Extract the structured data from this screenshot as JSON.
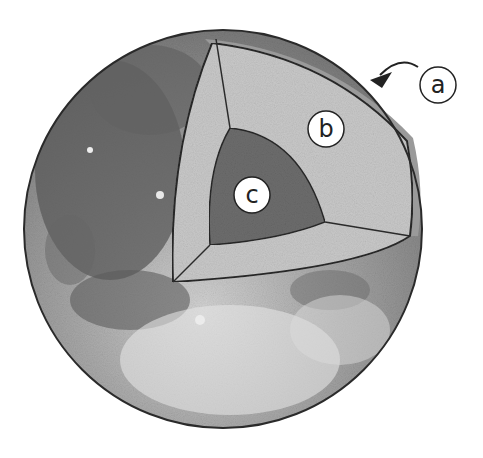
{
  "diagram": {
    "labels": [
      {
        "id": "a",
        "text": "a",
        "points_to": "crust"
      },
      {
        "id": "b",
        "text": "b",
        "points_to": "mantle"
      },
      {
        "id": "c",
        "text": "c",
        "points_to": "core"
      }
    ],
    "colors": {
      "background": "#ffffff",
      "surface_dark": "#5e5e5e",
      "surface_mid": "#8a8a8a",
      "surface_light": "#c4c4c4",
      "crust": "#9a9a9a",
      "mantle": "#c9c9c9",
      "core": "#6d6d6d",
      "outline": "#2a2a2a",
      "label_fill": "#ffffff"
    }
  }
}
